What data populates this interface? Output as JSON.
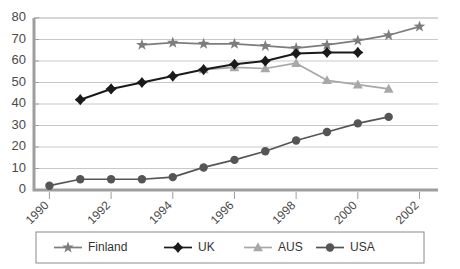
{
  "chart_data": {
    "type": "line",
    "title": "",
    "xlabel": "",
    "ylabel": "",
    "x": [
      1990,
      1991,
      1992,
      1993,
      1994,
      1995,
      1996,
      1997,
      1998,
      1999,
      2000,
      2001,
      2002
    ],
    "xlim": [
      1989.5,
      2002.6
    ],
    "ylim": [
      0,
      80
    ],
    "ytick_labels": [
      "0",
      "10",
      "20",
      "30",
      "40",
      "50",
      "60",
      "70",
      "80"
    ],
    "ytick_values": [
      0,
      10,
      20,
      30,
      40,
      50,
      60,
      70,
      80
    ],
    "xtick_labels": [
      "1990",
      "1992",
      "1994",
      "1996",
      "1998",
      "2000",
      "2002"
    ],
    "xtick_values": [
      1990,
      1992,
      1994,
      1996,
      1998,
      2000,
      2002
    ],
    "grid": "horizontal",
    "legend_position": "bottom",
    "series": [
      {
        "name": "Finland",
        "marker": "star",
        "color": "#7d7d7d",
        "x": [
          1993,
          1994,
          1995,
          1996,
          1997,
          1998,
          1999,
          2000,
          2001,
          2002
        ],
        "values": [
          67.5,
          68.5,
          68,
          68,
          67,
          66,
          67.5,
          69.5,
          72,
          76
        ]
      },
      {
        "name": "UK",
        "marker": "diamond",
        "color": "#1a1a1a",
        "x": [
          1991,
          1992,
          1993,
          1994,
          1995,
          1996,
          1997,
          1998,
          1999,
          2000
        ],
        "values": [
          42,
          47,
          50,
          53,
          56,
          58.5,
          60,
          63.5,
          64,
          64
        ]
      },
      {
        "name": "AUS",
        "marker": "triangle",
        "color": "#a8a8a8",
        "x": [
          1995,
          1996,
          1997,
          1998,
          1999,
          2000,
          2001
        ],
        "values": [
          56,
          57,
          56.5,
          59,
          51,
          49,
          47
        ]
      },
      {
        "name": "USA",
        "marker": "circle",
        "color": "#555555",
        "x": [
          1990,
          1991,
          1992,
          1993,
          1994,
          1995,
          1996,
          1997,
          1998,
          1999,
          2000,
          2001
        ],
        "values": [
          2,
          5,
          5,
          5,
          6,
          10.5,
          14,
          18,
          23,
          27,
          31,
          34
        ]
      }
    ],
    "legend": [
      {
        "label": "Finland",
        "marker": "star",
        "color": "#7d7d7d"
      },
      {
        "label": "UK",
        "marker": "diamond",
        "color": "#1a1a1a"
      },
      {
        "label": "AUS",
        "marker": "triangle",
        "color": "#a8a8a8"
      },
      {
        "label": "USA",
        "marker": "circle",
        "color": "#555555"
      }
    ]
  }
}
